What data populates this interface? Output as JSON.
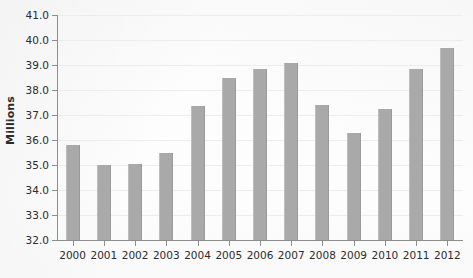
{
  "chart_data": {
    "type": "bar",
    "title": "",
    "subtitle": "",
    "xlabel": "",
    "ylabel": "Millions",
    "categories": [
      "2000",
      "2001",
      "2002",
      "2003",
      "2004",
      "2005",
      "2006",
      "2007",
      "2008",
      "2009",
      "2010",
      "2011",
      "2012"
    ],
    "values": [
      35.8,
      35.0,
      35.05,
      35.5,
      37.35,
      38.5,
      38.85,
      39.1,
      37.4,
      36.3,
      37.25,
      38.85,
      39.7
    ],
    "series": [
      {
        "name": "Millions",
        "values": [
          35.8,
          35.0,
          35.05,
          35.5,
          37.35,
          38.5,
          38.85,
          39.1,
          37.4,
          36.3,
          37.25,
          38.85,
          39.7
        ]
      }
    ],
    "ylim": [
      32.0,
      41.0
    ],
    "ytick_step": 1.0,
    "ytick_labels": [
      "41.0",
      "40.0",
      "39.0",
      "38.0",
      "37.0",
      "36.0",
      "35.0",
      "34.0",
      "33.0",
      "32.0"
    ],
    "ytick_values": [
      41.0,
      40.0,
      39.0,
      38.0,
      37.0,
      36.0,
      35.0,
      34.0,
      33.0,
      32.0
    ],
    "grid": true,
    "grid_axis": "y",
    "legend": false,
    "legend_position": "none",
    "bar_color": "#a9a9a9",
    "gridline_color": "#ececec",
    "axis_color": "#8e8e8e",
    "background_color": "#fdfdfd",
    "text_color": "#2c2c2c"
  }
}
